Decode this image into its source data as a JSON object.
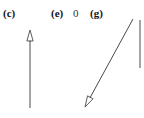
{
  "figure": {
    "width": 144,
    "height": 118,
    "background_color": "#ffffff",
    "stroke_color": "#4a4a4a",
    "label_color": "#141414",
    "plain_text_color": "#333333"
  },
  "labels": {
    "panel_c": "(c)",
    "panel_e": "(e)",
    "value_zero": "0",
    "panel_g": "(g)"
  },
  "chart_data": {
    "type": "diagram",
    "title": "",
    "panels": [
      {
        "label": "(c)",
        "label_position": [
          3,
          8
        ],
        "vectors": [
          {
            "name": "upward-vector",
            "tail": [
              30,
              108
            ],
            "tip": [
              30,
              30
            ],
            "direction_deg": 90,
            "length_px": 78,
            "arrowhead": "open-triangle",
            "arrowhead_at": "tip"
          }
        ]
      },
      {
        "label": "(e)",
        "label_position": [
          51,
          8
        ],
        "annotation": "0",
        "annotation_position": [
          73,
          8
        ],
        "vectors": []
      },
      {
        "label": "(g)",
        "label_position": [
          90,
          8
        ],
        "vectors": [
          {
            "name": "down-left-vector",
            "tail": [
              133,
              19
            ],
            "tip": [
              85,
              107
            ],
            "direction_deg": 241,
            "length_px": 100,
            "arrowhead": "open-triangle",
            "arrowhead_at": "tip"
          },
          {
            "name": "reference-line",
            "tail": [
              140,
              68
            ],
            "tip": [
              140,
              20
            ],
            "direction_deg": 90,
            "length_px": 48,
            "arrowhead": "none",
            "arrowhead_at": "none"
          }
        ]
      }
    ],
    "axis_ranges": {
      "x": [
        0,
        144
      ],
      "y": [
        0,
        118
      ]
    },
    "grid": false,
    "legend": null
  }
}
